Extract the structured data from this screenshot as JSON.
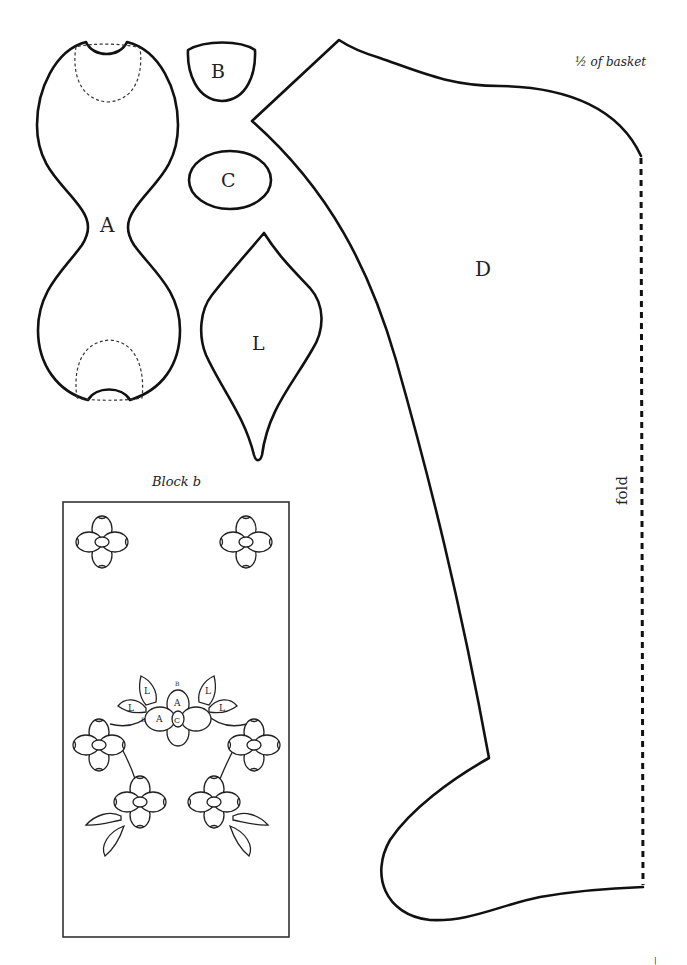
{
  "page": {
    "title_note": "½ of basket",
    "fold_label": "fold",
    "page_mark": "|",
    "colors": {
      "ink": "#111111",
      "background": "#ffffff"
    }
  },
  "pieces": {
    "A": {
      "label": "A"
    },
    "B": {
      "label": "B"
    },
    "C": {
      "label": "C"
    },
    "L": {
      "label": "L"
    },
    "D": {
      "label": "D"
    }
  },
  "block": {
    "title": "Block b",
    "labels": {
      "leaf_1": "L",
      "leaf_2": "L",
      "leaf_3": "L",
      "leaf_4": "L",
      "petal_top_b": "B",
      "petal_top_a": "A",
      "petal_left_b": "B",
      "petal_left_a": "A",
      "center_c": "C"
    }
  }
}
